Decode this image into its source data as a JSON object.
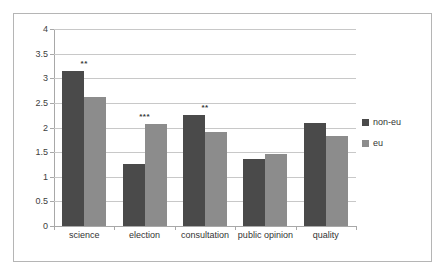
{
  "chart_data": {
    "type": "bar",
    "title": "",
    "subtitle": "",
    "xlabel": "",
    "ylabel": "",
    "categories": [
      "science",
      "election",
      "consultation",
      "public opinion",
      "quality"
    ],
    "series": [
      {
        "name": "non-eu",
        "color": "#4a4a4a",
        "values": [
          3.15,
          1.25,
          2.25,
          1.36,
          2.09
        ]
      },
      {
        "name": "eu",
        "color": "#8c8c8c",
        "values": [
          2.62,
          2.08,
          1.9,
          1.47,
          1.83
        ]
      }
    ],
    "annotations": [
      {
        "category": "science",
        "text": "**"
      },
      {
        "category": "election",
        "text": "***"
      },
      {
        "category": "consultation",
        "text": "**"
      },
      {
        "category": "public opinion",
        "text": ""
      },
      {
        "category": "quality",
        "text": ""
      }
    ],
    "ylim": [
      0,
      4
    ],
    "ytick_step": 0.5,
    "ytick_labels": [
      "0",
      "0.5",
      "1",
      "1.5",
      "2",
      "2.5",
      "3",
      "3.5",
      "4"
    ],
    "ytick_values": [
      0,
      0.5,
      1,
      1.5,
      2,
      2.5,
      3,
      3.5,
      4
    ],
    "grid": true,
    "legend_position": "right"
  },
  "legend": {
    "entries": [
      {
        "label": "non-eu",
        "color": "#4a4a4a"
      },
      {
        "label": "eu",
        "color": "#8c8c8c"
      }
    ]
  },
  "colors": {
    "series_non_eu": "#4a4a4a",
    "series_eu": "#8c8c8c",
    "gridline": "#c8c8c8",
    "frame_border": "#b5b5b5",
    "axis": "#a8a8a8",
    "text": "#333333",
    "background": "#ffffff"
  }
}
